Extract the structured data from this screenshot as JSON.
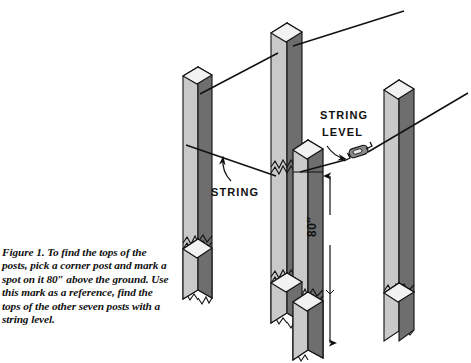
{
  "figure": {
    "caption_lead": "Figure 1.",
    "caption_text": " To find the tops of the posts, pick a corner post and mark a spot on it 80″ above the ground. Use this mark as a reference, find the tops of the other seven posts with a string level.",
    "caption_full": "Figure 1. To find the tops of the posts, pick a corner post and mark a spot on it 80″ above the ground. Use this mark as a reference, find the tops of the other seven posts with a string level."
  },
  "annotations": {
    "string_label": "STRING",
    "string_level_label_line1": "STRING",
    "string_level_label_line2": "LEVEL",
    "dimension_label": "80″"
  },
  "colors": {
    "ink": "#111111",
    "post_light_face": "#c9c9c9",
    "post_dark_face": "#6e6e6e",
    "post_top_face": "#f2f2f2",
    "background": "#ffffff"
  },
  "scene": {
    "description": "Isometric line drawing of four wooden fence posts with string lines and a string level",
    "posts": [
      {
        "id": "post-left",
        "label": "left post"
      },
      {
        "id": "post-tall-center",
        "label": "tall center post"
      },
      {
        "id": "post-corner",
        "label": "corner post"
      },
      {
        "id": "post-right",
        "label": "right post"
      }
    ],
    "strings": [
      {
        "id": "string-upper",
        "label": "upper string line"
      },
      {
        "id": "string-lower",
        "label": "lower string line through string level"
      }
    ]
  }
}
